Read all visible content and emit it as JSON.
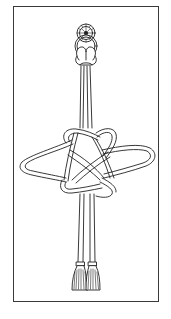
{
  "illustration": {
    "subject": "decorative-cord-knot",
    "parts": [
      "rosette",
      "ring",
      "cords",
      "knot",
      "tassels"
    ],
    "colors": {
      "line": "#222222",
      "frame": "#3a3a3a",
      "background": "#ffffff"
    }
  }
}
